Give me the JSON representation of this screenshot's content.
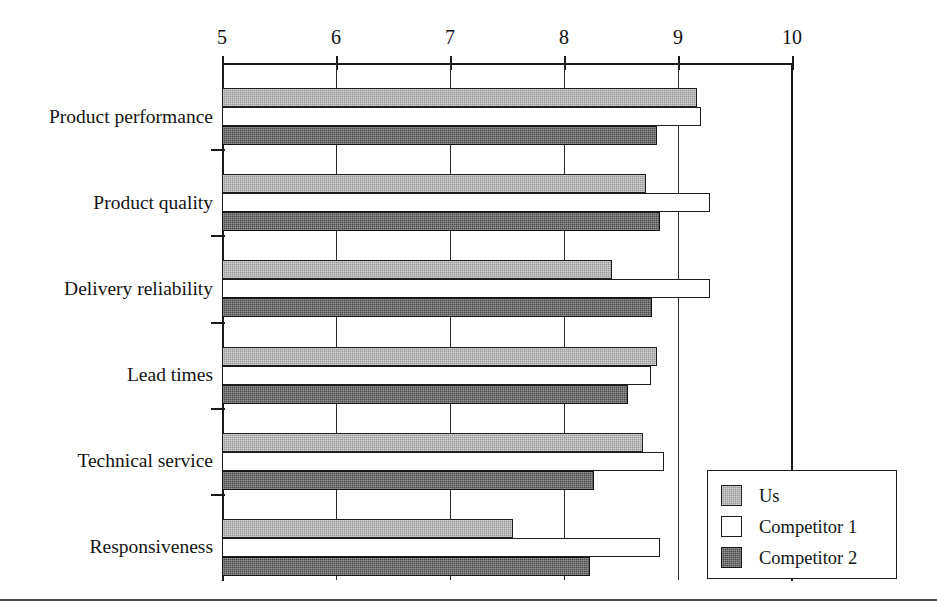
{
  "chart_data": {
    "type": "bar",
    "orientation": "horizontal",
    "title": "",
    "subtitle": "",
    "xlabel": "",
    "ylabel": "",
    "xlim": [
      5,
      10
    ],
    "xticks": [
      5,
      6,
      7,
      8,
      9,
      10
    ],
    "xtick_labels": [
      "5",
      "6",
      "7",
      "8",
      "9",
      "10"
    ],
    "axis_position": "top",
    "grid": true,
    "grid_axis": "x",
    "legend_position": "bottom-right",
    "categories": [
      "Product performance",
      "Product quality",
      "Delivery reliability",
      "Lead times",
      "Technical service",
      "Responsiveness"
    ],
    "series": [
      {
        "name": "Us",
        "color": "#9b9b9b",
        "values": [
          9.17,
          8.72,
          8.42,
          8.82,
          8.69,
          7.55
        ]
      },
      {
        "name": "Competitor 1",
        "color": "#ffffff",
        "values": [
          9.2,
          9.28,
          9.28,
          8.76,
          8.88,
          8.84
        ]
      },
      {
        "name": "Competitor 2",
        "color": "#4c4c4c",
        "values": [
          8.82,
          8.84,
          8.77,
          8.56,
          8.26,
          8.23
        ]
      }
    ]
  },
  "legend": {
    "items": [
      {
        "label": "Us",
        "swatch": "#9b9b9b",
        "pattern": "light-gray-hatch"
      },
      {
        "label": "Competitor 1",
        "swatch": "#ffffff",
        "pattern": "open-white"
      },
      {
        "label": "Competitor 2",
        "swatch": "#4c4c4c",
        "pattern": "dark-gray-hatch"
      }
    ]
  },
  "axis": {
    "tick_labels": [
      "5",
      "6",
      "7",
      "8",
      "9",
      "10"
    ]
  },
  "colors": {
    "us": "#9b9b9b",
    "competitor_1": "#ffffff",
    "competitor_2": "#4c4c4c",
    "axis": "#1a1a1a",
    "grid": "#2b2b2b",
    "text": "#141414",
    "background": "#ffffff"
  }
}
